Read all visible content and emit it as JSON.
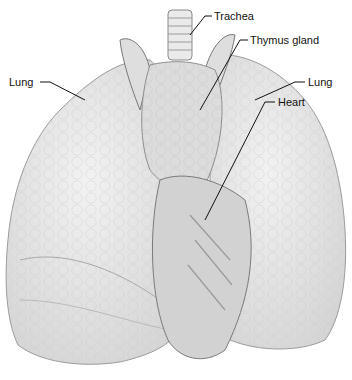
{
  "diagram": {
    "type": "anatomical-illustration",
    "labels": [
      {
        "id": "trachea",
        "text": "Trachea"
      },
      {
        "id": "thymus",
        "text": "Thymus gland"
      },
      {
        "id": "lung_left",
        "text": "Lung"
      },
      {
        "id": "lung_right",
        "text": "Lung"
      },
      {
        "id": "heart",
        "text": "Heart"
      }
    ]
  },
  "colors": {
    "lung_fill": "#e6e6e6",
    "lung_edge": "#9a9a9a",
    "thymus_fill": "#dcdcdc",
    "heart_fill": "#d2d2d2",
    "leader_line": "#111111",
    "text": "#111111"
  }
}
